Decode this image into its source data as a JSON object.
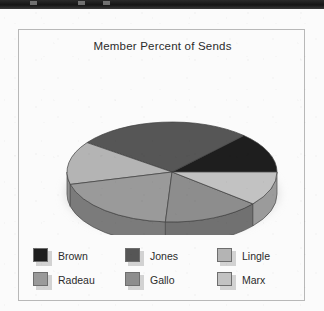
{
  "window": {
    "titlebar_visible": true,
    "titlebar_color": "#1a1a1a"
  },
  "frame": {
    "border_color": "#b8b8b8",
    "background_color": "#fbfbfb"
  },
  "chart": {
    "title": "Member Percent of Sends"
  },
  "legend": {
    "items": [
      {
        "label": "Brown",
        "color": "#1e1e1e"
      },
      {
        "label": "Radeau",
        "color": "#9a9a9a"
      },
      {
        "label": "Jones",
        "color": "#565656"
      },
      {
        "label": "Gallo",
        "color": "#8d8d8d"
      },
      {
        "label": "Lingle",
        "color": "#b4b4b4"
      },
      {
        "label": "Marx",
        "color": "#c2c2c2"
      }
    ]
  },
  "chart_data": {
    "type": "pie",
    "title": "Member Percent of Sends",
    "xlabel": "",
    "ylabel": "",
    "three_d": true,
    "legend_position": "bottom",
    "grid": false,
    "categories": [
      "Brown",
      "Jones",
      "Lingle",
      "Radeau",
      "Gallo",
      "Marx"
    ],
    "values": [
      13,
      27,
      14,
      20,
      15,
      11
    ],
    "unit": "percent",
    "series": [
      {
        "name": "Member Percent of Sends",
        "values": [
          13,
          27,
          14,
          20,
          15,
          11
        ]
      }
    ],
    "slices": [
      {
        "label": "Brown",
        "value": 13,
        "color": "#1e1e1e",
        "start_angle": -58,
        "end_angle": 0
      },
      {
        "label": "Jones",
        "value": 27,
        "color": "#565656",
        "start_angle": -154,
        "end_angle": -58
      },
      {
        "label": "Lingle",
        "value": 14,
        "color": "#b4b4b4",
        "start_angle": -204,
        "end_angle": -154
      },
      {
        "label": "Radeau",
        "value": 20,
        "color": "#9a9a9a",
        "start_angle": -276,
        "end_angle": -204
      },
      {
        "label": "Gallo",
        "value": 15,
        "color": "#8d8d8d",
        "start_angle": -330,
        "end_angle": -276
      },
      {
        "label": "Marx",
        "value": 11,
        "color": "#c2c2c2",
        "start_angle": -370,
        "end_angle": -330
      }
    ]
  }
}
